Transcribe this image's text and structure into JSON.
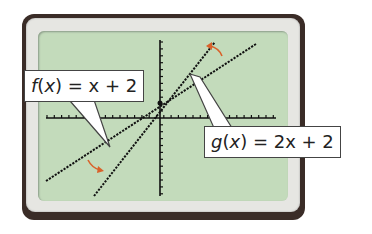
{
  "chart_data": {
    "type": "line",
    "title": "",
    "xlabel": "",
    "ylabel": "",
    "xlim": [
      -10.5,
      10.5
    ],
    "ylim": [
      -10,
      10
    ],
    "tick_step": 1,
    "grid": false,
    "series": [
      {
        "name": "f(x) = x + 2",
        "slope": 1,
        "intercept": 2,
        "x": [
          -10.5,
          10.5
        ],
        "y": [
          -8.5,
          12.5
        ],
        "style": "dotted",
        "color": "#111111"
      },
      {
        "name": "g(x) = 2x + 2",
        "slope": 2,
        "intercept": 2,
        "x": [
          -6,
          5
        ],
        "y": [
          -10,
          12
        ],
        "style": "dotted",
        "color": "#111111"
      }
    ],
    "annotations": [
      {
        "text": "f(x) = x + 2",
        "points_to": "f"
      },
      {
        "text": "g(x) = 2x + 2",
        "points_to": "g"
      },
      {
        "type": "rotation-arrow",
        "color": "#d9622b",
        "meaning": "f rotates to g"
      }
    ]
  },
  "labels": {
    "f": {
      "name": "f",
      "var": "x",
      "rhs": " = x + 2"
    },
    "g": {
      "name": "g",
      "var": "x",
      "rhs": " = 2x + 2"
    }
  },
  "colors": {
    "screen": "#c3dbbb",
    "arrow": "#d9622b",
    "frame": "#3a2c27"
  }
}
